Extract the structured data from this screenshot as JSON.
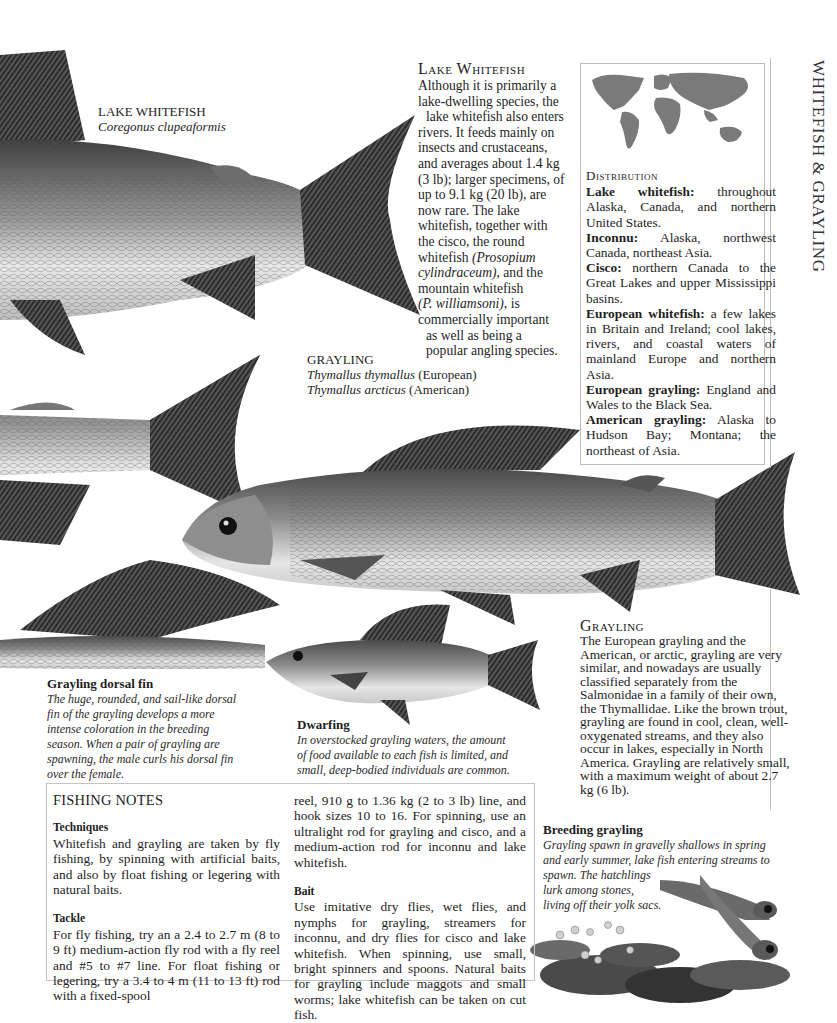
{
  "side_title": "WHITEFISH & GRAYLING",
  "lake_whitefish_label": {
    "name": "LAKE WHITEFISH",
    "latin": "Coregonus clupeaformis"
  },
  "lake_whitefish_article": {
    "heading": "Lake Whitefish",
    "lines": [
      "Although it is primarily a",
      "lake-dwelling species, the",
      "  lake whitefish also enters",
      "rivers. It feeds mainly on",
      "insects and crustaceans,",
      "and averages about 1.4 kg",
      "(3 lb); larger specimens, of",
      "up to 9.1 kg (20 lb), are",
      "now rare. The lake",
      "whitefish, together with",
      "the cisco, the round",
      "whitefish ",
      "cylindraceum), and the",
      "mountain whitefish",
      ", is",
      "commercially important",
      "  as well as being a",
      "  popular angling species."
    ],
    "italic_1": "(Prosopium",
    "italic_2": "cylindraceum)",
    "italic_3": "(P. williamsoni)"
  },
  "distribution": {
    "heading": "Distribution",
    "map_icon": "world-map-icon",
    "entries": [
      {
        "name": "Lake whitefish:",
        "text": " throughout Alaska, Canada, and northern United States."
      },
      {
        "name": "Inconnu:",
        "text": " Alaska, northwest Canada, northeast Asia."
      },
      {
        "name": "Cisco:",
        "text": " northern Canada to the Great Lakes and upper Mississippi basins."
      },
      {
        "name": "European whitefish:",
        "text": " a few lakes in Britain and Ireland; cool lakes, rivers, and coastal waters of mainland Europe and northern Asia."
      },
      {
        "name": "European grayling:",
        "text": " England and Wales to the Black Sea."
      },
      {
        "name": "American grayling:",
        "text": " Alaska to Hudson Bay; Montana; the northeast of Asia."
      }
    ]
  },
  "grayling_label": {
    "name": "GRAYLING",
    "latin_1": "Thymallus thymallus",
    "origin_1": " (European)",
    "latin_2": "Thymallus arcticus",
    "origin_2": " (American)"
  },
  "grayling_article": {
    "heading": "Grayling",
    "text": "The European grayling and the American, or arctic, grayling are very similar, and nowadays are usually classified separately from the Salmonidae in a family of their own, the Thymallidae. Like the brown trout, grayling are found in cool, clean, well-oxygenated streams, and they also occur in lakes, especially in North America. Grayling are relatively small, with a maximum weight of about 2.7 kg (6 lb)."
  },
  "captions": {
    "dorsal_fin": {
      "title": "Grayling dorsal fin",
      "text": "The huge, rounded, and sail-like dorsal fin of the grayling develops a more intense coloration in the breeding season. When a pair of grayling are spawning, the male curls his dorsal fin over the female."
    },
    "dwarfing": {
      "title": "Dwarfing",
      "text": "In overstocked grayling waters, the amount of food available to each fish is limited, and small, deep-bodied individuals are common."
    },
    "breeding": {
      "title": "Breeding grayling",
      "line_1": "Grayling spawn in gravelly shallows in spring",
      "line_2": "and early summer, lake fish entering streams to",
      "line_3": "spawn. The hatchlings",
      "line_4": "lurk among stones,",
      "line_5": "living off their yolk sacs."
    }
  },
  "fishing_notes": {
    "title": "FISHING NOTES",
    "techniques_heading": "Techniques",
    "techniques_text": "Whitefish and grayling are taken by fly fishing, by spinning with artificial baits, and also by float fishing or legering with natural baits.",
    "tackle_heading": "Tackle",
    "tackle_text": "For fly fishing, try an a 2.4 to 2.7 m (8 to 9 ft) medium-action fly rod with a fly reel and #5 to #7 line. For float fishing or legering, try a 3.4 to 4 m (11 to 13 ft) rod with a fixed-spool",
    "tackle_cont": "reel, 910 g to 1.36 kg (2 to 3 lb) line, and hook sizes 10 to 16. For spinning, use an ultralight rod for grayling and cisco, and a medium-action rod for inconnu and lake whitefish.",
    "bait_heading": "Bait",
    "bait_text": "Use imitative dry flies, wet flies, and nymphs for grayling, streamers for inconnu, and dry flies for cisco and lake whitefish. When spinning, use small, bright spinners and spoons. Natural baits for grayling include maggots and small worms; lake whitefish can be taken on cut fish."
  },
  "illustrations": {
    "lake_whitefish": "lake-whitefish-illustration",
    "grayling_main": "grayling-illustration",
    "grayling_dorsal": "grayling-dorsal-fin-illustration",
    "grayling_dwarf": "dwarf-grayling-illustration",
    "hatchlings": "grayling-hatchlings-illustration"
  },
  "colors": {
    "text": "#1e1e1e",
    "rule": "#bdbdbd",
    "fish_dark": "#3a3a3a",
    "fish_light": "#e4e4e4",
    "map": "#7a7a7a"
  }
}
